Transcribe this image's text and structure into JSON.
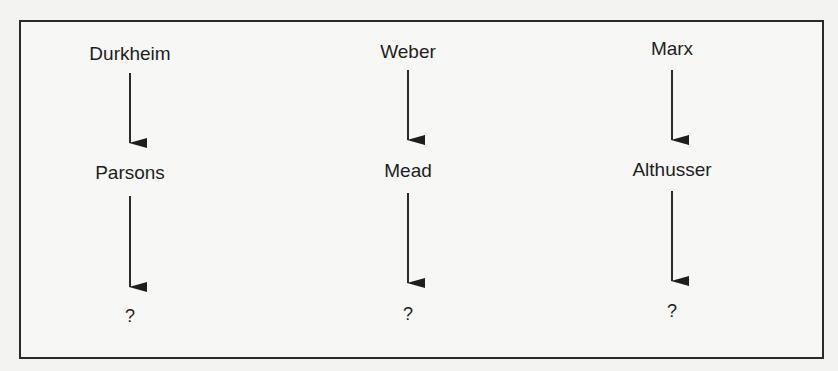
{
  "diagram": {
    "columns": [
      {
        "top": "Durkheim",
        "middle": "Parsons",
        "bottom": "?",
        "x": 130,
        "y_top": 44,
        "y_middle": 163,
        "y_bottom": 307,
        "arrows": [
          [
            73,
            143
          ],
          [
            196,
            287
          ]
        ]
      },
      {
        "top": "Weber",
        "middle": "Mead",
        "bottom": "?",
        "x": 408,
        "y_top": 42,
        "y_middle": 161,
        "y_bottom": 305,
        "arrows": [
          [
            70,
            140
          ],
          [
            193,
            283
          ]
        ]
      },
      {
        "top": "Marx",
        "middle": "Althusser",
        "bottom": "?",
        "x": 672,
        "y_top": 39,
        "y_middle": 160,
        "y_bottom": 302,
        "arrows": [
          [
            70,
            140
          ],
          [
            191,
            281
          ]
        ]
      }
    ],
    "colors": {
      "stroke": "#2a2a2a",
      "background": "#f3f3f1"
    }
  }
}
